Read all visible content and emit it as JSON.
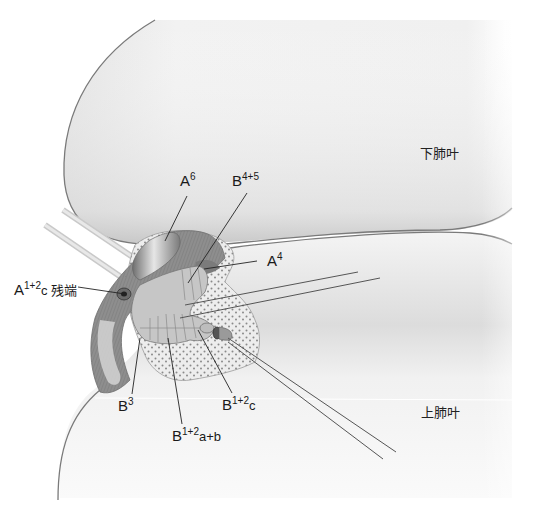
{
  "figure": {
    "type": "surgical anatomy illustration",
    "style": "grayscale",
    "colors": {
      "background": "#ffffff",
      "lung_surface": "#ececec",
      "lung_outline": "#7a7a7a",
      "vessel": "#8c8c8c",
      "bronchus": "#c8c8c8",
      "tissue_stipple": "#e6e6e6",
      "stipple_dot": "#8a8a8a",
      "label_text": "#1a1a1a",
      "leader_line": "#222222"
    }
  },
  "lobes": {
    "lower": "下肺叶",
    "upper": "上肺叶"
  },
  "labels": {
    "a6": {
      "base": "A",
      "sup": "6",
      "sub": ""
    },
    "b45": {
      "base": "B",
      "sup": "4+5",
      "sub": ""
    },
    "a4": {
      "base": "A",
      "sup": "4",
      "sub": ""
    },
    "a12c_stump": {
      "base": "A",
      "sup": "1+2",
      "sub": "c 残端"
    },
    "b3": {
      "base": "B",
      "sup": "3",
      "sub": ""
    },
    "b12ab": {
      "base": "B",
      "sup": "1+2",
      "sub": "a+b"
    },
    "b12c": {
      "base": "B",
      "sup": "1+2",
      "sub": "c"
    }
  }
}
